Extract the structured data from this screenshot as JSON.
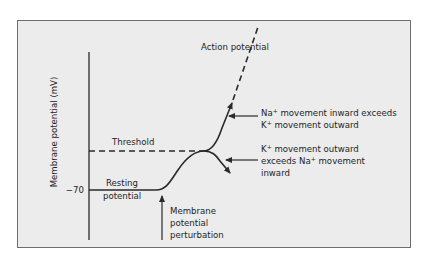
{
  "diagram": {
    "y_axis_label": "Membrane potential (mV)",
    "y_tick_label": "−70",
    "threshold_label": "Threshold",
    "resting_label": [
      "Resting",
      "potential"
    ],
    "action_potential_label": "Action potential",
    "perturbation_label": [
      "Membrane",
      "potential",
      "perturbation"
    ],
    "na_annotation": {
      "line1_prefix": "Na",
      "line1_sup": "+",
      "line1_suffix": " movement inward exceeds",
      "line2_prefix": "K",
      "line2_sup": "+",
      "line2_suffix": " movement outward"
    },
    "k_annotation": {
      "line1_prefix": "K",
      "line1_sup": "+",
      "line1_suffix": " movement outward",
      "line2_prefix": "exceeds Na",
      "line2_sup": "+",
      "line2_suffix": " movement",
      "line3": "inward"
    },
    "colors": {
      "background": "#ececec",
      "border": "#6e6e6e",
      "line": "#2a2a2a"
    }
  }
}
